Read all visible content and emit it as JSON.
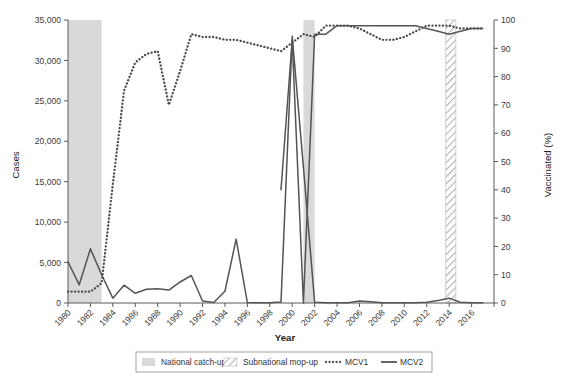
{
  "chart_data": {
    "type": "line",
    "title": "",
    "xlabel": "Year",
    "ylabel": "Cases",
    "y2label": "Vaccinated (%)",
    "grid": false,
    "legend_position": "bottom",
    "xlim": [
      1980,
      2018
    ],
    "ylim": [
      0,
      35000
    ],
    "y2lim": [
      0,
      100
    ],
    "xticks": [
      1980,
      1982,
      1984,
      1986,
      1988,
      1990,
      1992,
      1994,
      1996,
      1998,
      2000,
      2002,
      2004,
      2006,
      2008,
      2010,
      2012,
      2014,
      2016
    ],
    "xtick_labels": [
      "1980",
      "1982",
      "1984",
      "1986",
      "1988",
      "1990",
      "1992",
      "1994",
      "1996",
      "1998",
      "2000",
      "2002",
      "2004",
      "2006",
      "2008",
      "2010",
      "2012",
      "2014",
      "2016"
    ],
    "yticks": [
      0,
      5000,
      10000,
      15000,
      20000,
      25000,
      30000,
      35000
    ],
    "ytick_labels": [
      "0",
      "5,000",
      "10,000",
      "15,000",
      "20,000",
      "25,000",
      "30,000",
      "35,000"
    ],
    "y2ticks": [
      0,
      10,
      20,
      30,
      40,
      50,
      60,
      70,
      80,
      90,
      100
    ],
    "y2tick_labels": [
      "0",
      "10",
      "20",
      "30",
      "40",
      "50",
      "60",
      "70",
      "80",
      "90",
      "100"
    ],
    "x": [
      1980,
      1981,
      1982,
      1983,
      1984,
      1985,
      1986,
      1987,
      1988,
      1989,
      1990,
      1991,
      1992,
      1993,
      1994,
      1995,
      1996,
      1997,
      1998,
      1999,
      2000,
      2001,
      2002,
      2003,
      2004,
      2005,
      2006,
      2007,
      2008,
      2009,
      2010,
      2011,
      2012,
      2013,
      2014,
      2015,
      2016,
      2017
    ],
    "series": [
      {
        "name": "Cases",
        "axis": "left",
        "style": "solid",
        "values": [
          5100,
          2250,
          6700,
          3500,
          600,
          2200,
          1200,
          1700,
          1750,
          1600,
          2600,
          3400,
          250,
          60,
          1450,
          7900,
          60,
          40,
          40,
          120,
          33000,
          16800,
          80,
          40,
          40,
          40,
          250,
          150,
          40,
          40,
          40,
          40,
          100,
          300,
          600,
          100,
          40,
          40
        ]
      },
      {
        "name": "MCV1",
        "axis": "right",
        "style": "dotted",
        "values": [
          4,
          4,
          4,
          7,
          42,
          75,
          85,
          88,
          89,
          70,
          82,
          95,
          94,
          94,
          93,
          93,
          92,
          91,
          90,
          89,
          92,
          95,
          94,
          98,
          98,
          98,
          97,
          95,
          93,
          93,
          94,
          96,
          98,
          98,
          98,
          97,
          97,
          97
        ]
      },
      {
        "name": "MCV2",
        "axis": "right",
        "style": "solid",
        "values": [
          null,
          null,
          null,
          null,
          null,
          null,
          null,
          null,
          null,
          null,
          null,
          null,
          null,
          null,
          null,
          null,
          null,
          null,
          null,
          40,
          93,
          0,
          95,
          95,
          98,
          98,
          98,
          98,
          98,
          98,
          98,
          98,
          97,
          96,
          95,
          96,
          97,
          97
        ]
      }
    ],
    "bands": [
      {
        "label": "National catch-up",
        "style": "solid-fill",
        "x_start": 1980,
        "x_end": 1983
      },
      {
        "label": "National catch-up",
        "style": "solid-fill",
        "x_start": 2001,
        "x_end": 2002
      },
      {
        "label": "Subnational mop-up",
        "style": "hatched",
        "x_start": 2013.7,
        "x_end": 2014.6
      }
    ],
    "legend": [
      {
        "label": "National catch-up",
        "marker": "filled-swatch"
      },
      {
        "label": "Subnational mop-up",
        "marker": "hatched-swatch"
      },
      {
        "label": "MCV1",
        "marker": "dotted-line"
      },
      {
        "label": "MCV2",
        "marker": "solid-line"
      }
    ],
    "colors": {
      "line": "#545454",
      "band_fill": "#d9d9d9",
      "hatch": "#9a9a9a",
      "axis": "#5a5a5a",
      "text": "#333333"
    }
  }
}
